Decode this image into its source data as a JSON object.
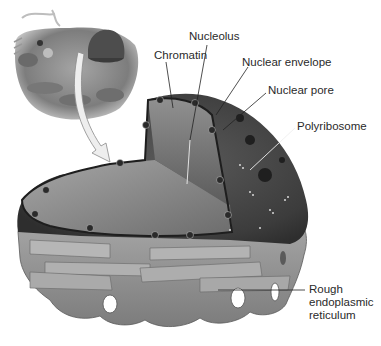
{
  "figure": {
    "inset": "whole cell cutaway",
    "labels": [
      {
        "id": "nucleolus",
        "text": "Nucleolus",
        "x": 189,
        "y": 37
      },
      {
        "id": "chromatin",
        "text": "Chromatin",
        "x": 154,
        "y": 54
      },
      {
        "id": "nuclear-envelope",
        "text": "Nuclear envelope",
        "x": 242,
        "y": 59
      },
      {
        "id": "nuclear-pore",
        "text": "Nuclear pore",
        "x": 268,
        "y": 86
      },
      {
        "id": "polyribosome",
        "text": "Polyribosome",
        "x": 297,
        "y": 121
      },
      {
        "id": "rough-er",
        "text": "Rough endoplasmic reticulum",
        "lines": [
          "Rough",
          "endoplasmic",
          "reticulum"
        ],
        "x": 309,
        "y": 283
      }
    ],
    "colors": {
      "background": "#ffffff",
      "label_text": "#2a2a2a",
      "leader_line": "#222222",
      "leader_line_light": "#e8e8e8",
      "nucleus_dark": "#4a4a4a",
      "nucleoplasm": "#9a9a9a",
      "er_fill": "#8e8e8e",
      "er_light": "#b3b3b3",
      "arrow_fill": "#eeeeee"
    }
  }
}
